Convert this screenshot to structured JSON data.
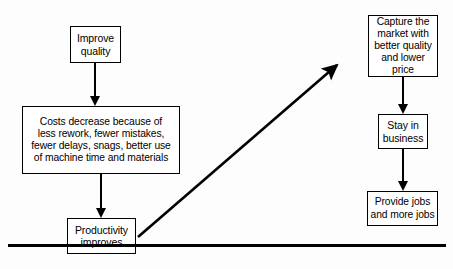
{
  "diagram": {
    "background_color": "#fdfdfd",
    "line_color": "#000000",
    "nodes": [
      {
        "id": "improve-quality",
        "label": "Improve\nquality"
      },
      {
        "id": "costs-decrease",
        "label": "Costs decrease because of\nless rework, fewer mistakes,\nfewer delays, snags, better use\nof machine time and materials"
      },
      {
        "id": "productivity-improves",
        "label": "Productivity\nimproves"
      },
      {
        "id": "capture-market",
        "label": "Capture the\nmarket with\nbetter quality\nand lower price"
      },
      {
        "id": "stay-in-business",
        "label": "Stay in\nbusiness"
      },
      {
        "id": "provide-jobs",
        "label": "Provide jobs\nand more jobs"
      }
    ],
    "edges": [
      {
        "id": "quality-to-costs",
        "from": "improve-quality",
        "to": "costs-decrease",
        "direction": "down"
      },
      {
        "id": "costs-to-productivity",
        "from": "costs-decrease",
        "to": "productivity-improves",
        "direction": "down"
      },
      {
        "id": "productivity-to-capture",
        "from": "productivity-improves",
        "to": "capture-market",
        "direction": "diagonal-up-right"
      },
      {
        "id": "capture-to-stay",
        "from": "capture-market",
        "to": "stay-in-business",
        "direction": "down"
      },
      {
        "id": "stay-to-jobs",
        "from": "stay-in-business",
        "to": "provide-jobs",
        "direction": "down"
      }
    ],
    "bottom_rule": {
      "id": "bottom-rule"
    }
  }
}
